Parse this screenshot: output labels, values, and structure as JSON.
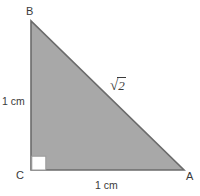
{
  "figure": {
    "shape_type": "right-triangle",
    "fill_color": "#a8a8a8",
    "stroke_color": "#6b6b6b",
    "background_color": "#ffffff",
    "label_color": "#3a3a3a",
    "right_angle_marker": {
      "name": "right-angle-marker",
      "at_vertex": "C",
      "fill": "#ffffff",
      "size_px": 14
    },
    "vertices": [
      {
        "name": "B",
        "label": "B",
        "x": 31,
        "y": 21
      },
      {
        "name": "C",
        "label": "C",
        "x": 31,
        "y": 170
      },
      {
        "name": "A",
        "label": "A",
        "x": 184,
        "y": 170
      }
    ],
    "sides": [
      {
        "name": "BC",
        "label": "1 cm",
        "position": "left",
        "kind": "leg"
      },
      {
        "name": "CA",
        "label": "1 cm",
        "position": "bottom",
        "kind": "leg"
      },
      {
        "name": "AB",
        "label": "√2",
        "radical_sign": "√",
        "radicand": "2",
        "position": "hypotenuse",
        "kind": "hypotenuse"
      }
    ]
  },
  "labels": {
    "vertex_b": "B",
    "vertex_c": "C",
    "vertex_a": "A",
    "leg_vertical": "1 cm",
    "leg_horizontal": "1 cm",
    "hypotenuse_sign": "√",
    "hypotenuse_radicand": "2"
  }
}
